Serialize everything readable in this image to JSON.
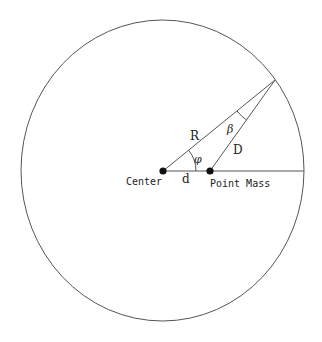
{
  "diagram": {
    "colors": {
      "stroke": "#555555",
      "dot": "#111111",
      "text": "#222222",
      "background": "#ffffff"
    },
    "circle": {
      "cx": 162.5,
      "cy": 170.5,
      "rx": 141.5,
      "ry": 150.5
    },
    "points": {
      "center": {
        "x": 163,
        "y": 171,
        "label": "Center"
      },
      "point_mass": {
        "x": 210,
        "y": 171,
        "label": "Point Mass"
      },
      "apex": {
        "x": 275,
        "y": 80
      },
      "right_edge": {
        "x": 304,
        "y": 171
      }
    },
    "labels": {
      "R": "R",
      "D": "D",
      "d": "d",
      "phi": "φ",
      "beta": "β",
      "center": "Center",
      "point_mass": "Point Mass"
    }
  }
}
